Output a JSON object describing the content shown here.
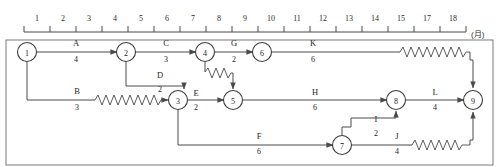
{
  "diagram": {
    "unit_label": "(月)",
    "colors": {
      "line": "#4a4a4a",
      "text": "#1e1e1e",
      "background": "#ffffff",
      "frame": "#6b6b6b"
    },
    "timescale": {
      "ticks": [
        "1",
        "2",
        "3",
        "4",
        "5",
        "6",
        "7",
        "8",
        "9",
        "10",
        "11",
        "12",
        "13",
        "14",
        "15",
        "17",
        "18"
      ]
    },
    "nodes": [
      {
        "id": "1",
        "label": "1",
        "cx": 27,
        "cy": 52
      },
      {
        "id": "2",
        "label": "2",
        "cx": 126,
        "cy": 52
      },
      {
        "id": "3",
        "label": "3",
        "cx": 178,
        "cy": 100
      },
      {
        "id": "4",
        "label": "4",
        "cx": 205,
        "cy": 52
      },
      {
        "id": "5",
        "label": "5",
        "cx": 233,
        "cy": 100
      },
      {
        "id": "6",
        "label": "6",
        "cx": 262,
        "cy": 52
      },
      {
        "id": "7",
        "label": "7",
        "cx": 342,
        "cy": 145
      },
      {
        "id": "8",
        "label": "8",
        "cx": 396,
        "cy": 100
      },
      {
        "id": "9",
        "label": "9",
        "cx": 473,
        "cy": 100
      }
    ],
    "activities": [
      {
        "key": "A",
        "name": "A",
        "duration": "4",
        "from": "1",
        "to": "2",
        "label_x": 76,
        "name_y": 46,
        "dur_y": 62
      },
      {
        "key": "C",
        "name": "C",
        "duration": "3",
        "from": "2",
        "to": "4",
        "label_x": 166,
        "name_y": 46,
        "dur_y": 62
      },
      {
        "key": "G",
        "name": "G",
        "duration": "2",
        "from": "4",
        "to": "6",
        "label_x": 234,
        "name_y": 46,
        "dur_y": 62
      },
      {
        "key": "K",
        "name": "K",
        "duration": "6",
        "from": "6",
        "to": "9",
        "label_x": 313,
        "name_y": 46,
        "dur_y": 62
      },
      {
        "key": "D",
        "name": "D",
        "duration": "2",
        "from": "2",
        "to": "3",
        "label_x": 160,
        "name_y": 78,
        "dur_y": 92
      },
      {
        "key": "B",
        "name": "B",
        "duration": "3",
        "from": "1",
        "to": "3",
        "label_x": 77,
        "name_y": 94,
        "dur_y": 110
      },
      {
        "key": "E",
        "name": "E",
        "duration": "2",
        "from": "3",
        "to": "5",
        "label_x": 196,
        "name_y": 96,
        "dur_y": 110
      },
      {
        "key": "H",
        "name": "H",
        "duration": "6",
        "from": "5",
        "to": "8",
        "label_x": 315,
        "name_y": 95,
        "dur_y": 110
      },
      {
        "key": "L",
        "name": "L",
        "duration": "4",
        "from": "8",
        "to": "9",
        "label_x": 435,
        "name_y": 95,
        "dur_y": 110
      },
      {
        "key": "F",
        "name": "F",
        "duration": "6",
        "from": "3",
        "to": "7",
        "label_x": 259,
        "name_y": 139,
        "dur_y": 154
      },
      {
        "key": "I",
        "name": "I",
        "duration": "2",
        "from": "7",
        "to": "8",
        "label_x": 376,
        "name_y": 122,
        "dur_y": 136
      },
      {
        "key": "J",
        "name": "J",
        "duration": "4",
        "from": "7",
        "to": "9",
        "label_x": 397,
        "name_y": 139,
        "dur_y": 154
      }
    ]
  }
}
